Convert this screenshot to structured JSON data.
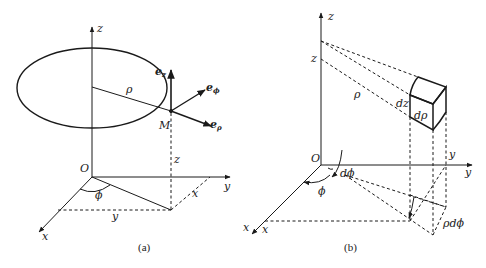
{
  "figure": {
    "panels": [
      {
        "id": "a",
        "caption": "(a)",
        "labels": {
          "z_axis": "z",
          "y_axis": "y",
          "x_axis": "x",
          "origin": "O",
          "radius": "ρ",
          "point": "M",
          "height": "z",
          "angle": "ϕ",
          "proj_x": "x",
          "proj_y": "y",
          "e_z_base": "e",
          "e_z_sub": "z",
          "e_phi_base": "e",
          "e_phi_sub": "ϕ",
          "e_rho_base": "e",
          "e_rho_sub": "ρ"
        }
      },
      {
        "id": "b",
        "caption": "(b)",
        "labels": {
          "z_axis": "z",
          "z_mark": "z",
          "y_axis": "y",
          "y_mark": "y",
          "x_axis": "x",
          "x_mark": "x",
          "origin": "O",
          "radius": "ρ",
          "dz": "dz",
          "drho": "dρ",
          "dphi": "dϕ",
          "phi": "ϕ",
          "rho_dphi": "ρdϕ"
        }
      }
    ]
  },
  "colors": {
    "stroke": "#1a1a1a",
    "background": "#ffffff"
  }
}
